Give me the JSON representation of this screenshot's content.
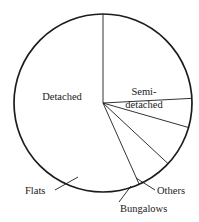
{
  "chart_data": {
    "type": "pie",
    "title": "",
    "subtitle": "",
    "xlabel": "",
    "ylabel": "",
    "legend_position": "none",
    "grid": false,
    "labels_on_chart": true,
    "categories": [
      "Detached",
      "Semi-detached",
      "Others",
      "Bungalows",
      "Flats"
    ],
    "values": [
      56.7,
      24.2,
      5.3,
      7.5,
      6.3
    ],
    "unit": "percent",
    "series": [
      {
        "name": "Housing types",
        "values": [
          56.7,
          24.2,
          5.3,
          7.5,
          6.3
        ]
      }
    ],
    "slices": [
      {
        "label": "Detached",
        "value": 56.7,
        "start_angle_deg": 204,
        "end_angle_deg": 360,
        "label_placement": "inside",
        "label_lines": [
          "Detached"
        ]
      },
      {
        "label": "Semi-detached",
        "value": 24.2,
        "start_angle_deg": 0,
        "end_angle_deg": 87,
        "label_placement": "inside",
        "label_lines": [
          "Semi-",
          "detached"
        ]
      },
      {
        "label": "Others",
        "value": 5.3,
        "start_angle_deg": 87,
        "end_angle_deg": 106,
        "label_placement": "callout",
        "label_lines": [
          "Others"
        ]
      },
      {
        "label": "Bungalows",
        "value": 7.5,
        "start_angle_deg": 106,
        "end_angle_deg": 133,
        "label_placement": "callout",
        "label_lines": [
          "Bungalows"
        ]
      },
      {
        "label": "Flats",
        "value": 6.3,
        "start_angle_deg": 133,
        "end_angle_deg": 156,
        "label_placement": "callout",
        "label_lines": [
          "Flats"
        ]
      }
    ],
    "geometry": {
      "center_x": 103,
      "center_y": 103,
      "radius": 89,
      "stroke_color": "#1c1c1c",
      "fill_color": "#ffffff"
    }
  },
  "labels": {
    "detached": "Detached",
    "semi_line1": "Semi-",
    "semi_line2": "detached",
    "flats": "Flats",
    "bungalows": "Bungalows",
    "others": "Others"
  }
}
